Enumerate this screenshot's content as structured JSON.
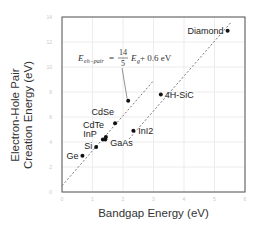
{
  "chart_data": {
    "type": "scatter",
    "title": "",
    "xlabel": "Bandgap Energy (eV)",
    "ylabel": "Electron-Hole Pair Creation Energy (eV)",
    "ylabel_lines": [
      "Electron-Hole Pair",
      "Creation Energy (eV)"
    ],
    "xlim": [
      0,
      6
    ],
    "ylim": [
      0,
      14
    ],
    "xticks": [
      0,
      1,
      2,
      3,
      4,
      5,
      6
    ],
    "yticks": [
      0,
      2,
      4,
      6,
      8,
      10,
      12,
      14
    ],
    "grid": true,
    "legend": "none",
    "points": [
      {
        "label": "Ge",
        "x": 0.67,
        "y": 2.9
      },
      {
        "label": "Si",
        "x": 1.12,
        "y": 3.6
      },
      {
        "label": "InP",
        "x": 1.34,
        "y": 4.2
      },
      {
        "label": "GaAs",
        "x": 1.42,
        "y": 4.2
      },
      {
        "label": "CdTe",
        "x": 1.44,
        "y": 4.4
      },
      {
        "label": "CdSe",
        "x": 1.74,
        "y": 5.5
      },
      {
        "label": "",
        "x": 2.17,
        "y": 7.3
      },
      {
        "label": "InI2",
        "x": 2.34,
        "y": 4.9
      },
      {
        "label": "4H-SiC",
        "x": 3.24,
        "y": 7.8
      },
      {
        "label": "Diamond",
        "x": 5.43,
        "y": 12.9
      }
    ],
    "lines": [
      {
        "name": "upper-fit",
        "style": "dashed",
        "x": [
          0.0,
          3.0
        ],
        "y": [
          0.5,
          8.9
        ]
      },
      {
        "name": "lower-fit",
        "style": "dashed",
        "x": [
          2.2,
          5.55
        ],
        "y": [
          4.25,
          13.6
        ]
      }
    ],
    "annotation": {
      "text_lhs": "E",
      "text_sub": "eh−pair",
      "text_eq": " = ",
      "frac_num": "14",
      "frac_den": "5",
      "text_rhs": "E",
      "text_rhs_sub": "g",
      "text_tail": " + 0.6 eV",
      "arrow_to": {
        "x": 2.17,
        "y": 7.3
      }
    }
  }
}
